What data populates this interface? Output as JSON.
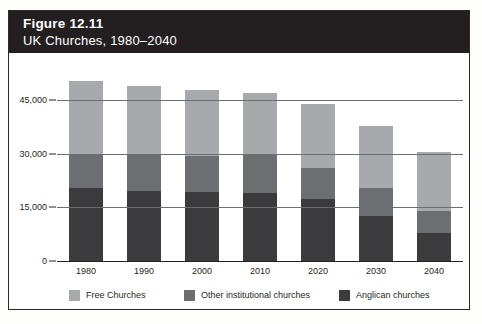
{
  "figure": {
    "number_label": "Figure 12.11",
    "subtitle": "UK Churches, 1980–2040"
  },
  "chart_data": {
    "type": "bar",
    "subtype": "stacked-vertical",
    "title": "UK Churches, 1980–2040",
    "xlabel": "",
    "ylabel": "",
    "ylim": [
      0,
      52000
    ],
    "yticks": [
      0,
      15000,
      30000,
      45000
    ],
    "ytick_labels": [
      "0",
      "15,000",
      "30,000",
      "45,000"
    ],
    "grid": true,
    "legend_position": "bottom",
    "categories": [
      "1980",
      "1990",
      "2000",
      "2010",
      "2020",
      "2030",
      "2040"
    ],
    "series": [
      {
        "name": "Anglican churches",
        "color": "#3b3b3d",
        "values": [
          20300,
          19500,
          19300,
          18900,
          17400,
          12500,
          7800
        ]
      },
      {
        "name": "Other institutional churches",
        "color": "#6d6e71",
        "values": [
          9500,
          10000,
          10000,
          10600,
          8700,
          7800,
          6100
        ]
      },
      {
        "name": "Free Churches",
        "color": "#a7a9ac",
        "values": [
          20500,
          19300,
          18400,
          17500,
          17700,
          17400,
          16600
        ]
      }
    ],
    "totals": [
      50300,
      48800,
      47700,
      47000,
      43800,
      37700,
      30500
    ]
  },
  "legend": [
    {
      "label": "Free Churches",
      "color": "#a7a9ac",
      "swatch": "legend-swatch-free"
    },
    {
      "label": "Other institutional churches",
      "color": "#6d6e71",
      "swatch": "legend-swatch-other"
    },
    {
      "label": "Anglican churches",
      "color": "#3b3b3d",
      "swatch": "legend-swatch-anglican"
    }
  ]
}
